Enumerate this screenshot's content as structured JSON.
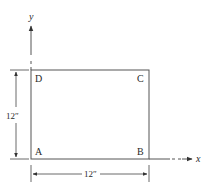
{
  "figure": {
    "axes": {
      "x_label": "x",
      "y_label": "y"
    },
    "corners": {
      "A": "A",
      "B": "B",
      "C": "C",
      "D": "D"
    },
    "dimensions": {
      "height": "12″",
      "width": "12″"
    },
    "colors": {
      "line": "#555555",
      "text": "#2a2a2a"
    }
  }
}
